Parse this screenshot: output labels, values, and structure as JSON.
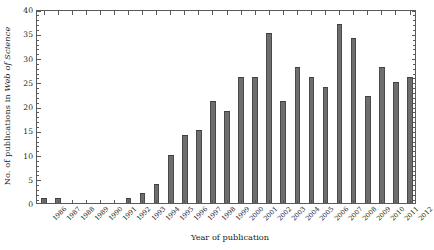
{
  "chart_data": {
    "type": "bar",
    "title": "",
    "xlabel": "Year of publication",
    "ylabel_plain": "No. of publications in Web of Science",
    "ylabel_prefix": "No. of publications in ",
    "ylabel_italic": "Web of Science",
    "categories": [
      "1986",
      "1987",
      "1988",
      "1989",
      "1990",
      "1991",
      "1992",
      "1993",
      "1994",
      "1995",
      "1996",
      "1997",
      "1998",
      "1999",
      "2000",
      "2001",
      "2002",
      "2003",
      "2004",
      "2005",
      "2006",
      "2007",
      "2008",
      "2009",
      "2010",
      "2011",
      "2012"
    ],
    "values": [
      1,
      1,
      0,
      0,
      0,
      0,
      1,
      2,
      4,
      10,
      14,
      15,
      21,
      19,
      26,
      26,
      35,
      21,
      28,
      26,
      24,
      37,
      34,
      22,
      28,
      25,
      26
    ],
    "ylim": [
      0,
      40
    ],
    "ytick_labels": [
      "0",
      "5",
      "10",
      "15",
      "20",
      "25",
      "30",
      "35",
      "40"
    ],
    "ytick_values": [
      0,
      5,
      10,
      15,
      20,
      25,
      30,
      35,
      40
    ],
    "ytick_step": 5,
    "ytick_minor_step": 1,
    "grid": false,
    "legend": null,
    "bar_color": "#6e6e6e",
    "bar_edge_color": "#4a4a4a",
    "axis_color": "#5a5a5a",
    "text_color": "#1a1a1a",
    "background_color": "#ffffff"
  }
}
